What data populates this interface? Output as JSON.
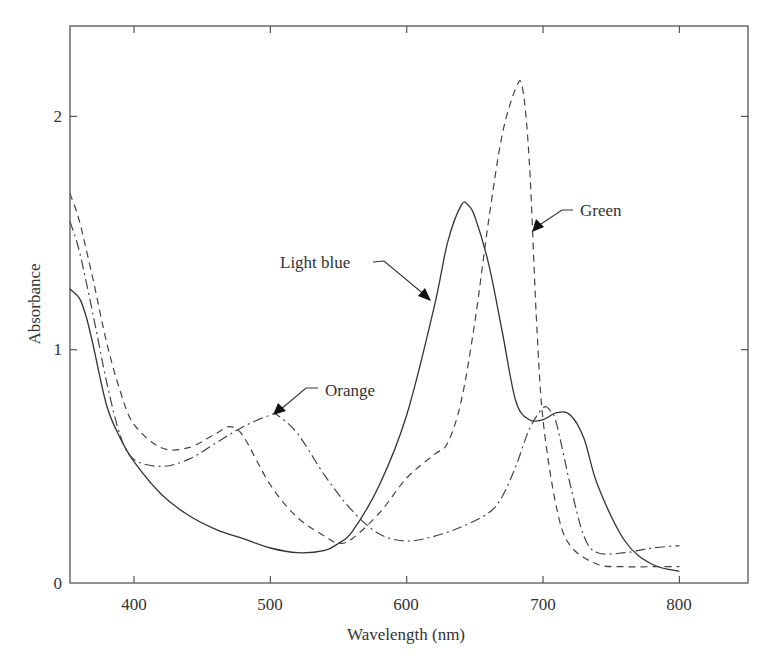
{
  "chart_data": {
    "type": "line",
    "title": "",
    "xlabel": "Wavelength (nm)",
    "ylabel": "Absorbance",
    "xlim": [
      353,
      849
    ],
    "ylim": [
      0,
      2.4
    ],
    "xticks": [
      400,
      500,
      600,
      700,
      800
    ],
    "yticks": [
      0,
      1,
      2
    ],
    "grid": false,
    "legend": "none (inline arrow annotations)",
    "series": [
      {
        "name": "Light blue",
        "style": "solid",
        "x": [
          353,
          360,
          365,
          370,
          380,
          390,
          400,
          420,
          440,
          460,
          480,
          500,
          520,
          540,
          550,
          560,
          580,
          600,
          620,
          630,
          640,
          645,
          650,
          660,
          670,
          680,
          690,
          700,
          710,
          720,
          730,
          740,
          760,
          780,
          800
        ],
        "y": [
          1.26,
          1.22,
          1.14,
          1.02,
          0.76,
          0.62,
          0.52,
          0.38,
          0.29,
          0.23,
          0.19,
          0.15,
          0.13,
          0.14,
          0.17,
          0.22,
          0.42,
          0.72,
          1.18,
          1.46,
          1.62,
          1.62,
          1.57,
          1.37,
          1.08,
          0.78,
          0.7,
          0.7,
          0.73,
          0.72,
          0.62,
          0.42,
          0.18,
          0.08,
          0.05
        ]
      },
      {
        "name": "Green",
        "style": "dashed",
        "x": [
          353,
          360,
          370,
          380,
          390,
          400,
          420,
          440,
          460,
          470,
          480,
          500,
          520,
          540,
          550,
          560,
          580,
          600,
          620,
          630,
          640,
          650,
          660,
          670,
          680,
          685,
          690,
          695,
          700,
          710,
          720,
          740,
          760,
          780,
          800
        ],
        "y": [
          1.67,
          1.55,
          1.3,
          1.03,
          0.82,
          0.68,
          0.58,
          0.58,
          0.64,
          0.67,
          0.63,
          0.42,
          0.28,
          0.2,
          0.17,
          0.19,
          0.3,
          0.45,
          0.55,
          0.6,
          0.78,
          1.12,
          1.55,
          1.92,
          2.12,
          2.12,
          1.8,
          1.15,
          0.7,
          0.32,
          0.16,
          0.08,
          0.07,
          0.07,
          0.07
        ]
      },
      {
        "name": "Orange",
        "style": "dash-dot",
        "x": [
          353,
          360,
          370,
          380,
          390,
          400,
          420,
          440,
          460,
          480,
          500,
          505,
          520,
          540,
          560,
          580,
          600,
          620,
          640,
          660,
          670,
          680,
          690,
          700,
          705,
          710,
          720,
          730,
          740,
          760,
          780,
          800
        ],
        "y": [
          1.55,
          1.42,
          1.15,
          0.86,
          0.63,
          0.53,
          0.5,
          0.53,
          0.6,
          0.67,
          0.72,
          0.72,
          0.64,
          0.46,
          0.31,
          0.21,
          0.18,
          0.2,
          0.24,
          0.3,
          0.37,
          0.5,
          0.66,
          0.75,
          0.74,
          0.68,
          0.42,
          0.2,
          0.13,
          0.13,
          0.15,
          0.16
        ]
      }
    ],
    "annotations": [
      {
        "text": "Light blue",
        "target_series": "Light blue",
        "target_point": [
          625,
          1.21
        ]
      },
      {
        "text": "Green",
        "target_series": "Green",
        "target_point": [
          694,
          1.5
        ]
      },
      {
        "text": "Orange",
        "target_series": "Orange",
        "target_point": [
          503,
          0.72
        ]
      }
    ]
  },
  "labels": {
    "xlabel": "Wavelength (nm)",
    "ylabel": "Absorbance",
    "xticks": [
      "400",
      "500",
      "600",
      "700",
      "800"
    ],
    "yticks": [
      "0",
      "1",
      "2"
    ],
    "annot_light_blue": "Light blue",
    "annot_green": "Green",
    "annot_orange": "Orange"
  }
}
